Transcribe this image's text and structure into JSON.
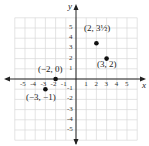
{
  "axes": {
    "x_label": "x",
    "y_label": "y",
    "x_ticks": [
      "-5",
      "-4",
      "-3",
      "-2",
      "-1",
      "1",
      "2",
      "3",
      "4",
      "5"
    ],
    "y_ticks": [
      "5",
      "4",
      "3",
      "2",
      "1",
      "-1",
      "-2",
      "-3",
      "-4",
      "-5"
    ],
    "range": [
      -6,
      6
    ]
  },
  "points": [
    {
      "x": -2,
      "y": 0,
      "label": "(−2, 0)"
    },
    {
      "x": -3,
      "y": -1,
      "label": "(−3, −1)"
    },
    {
      "x": 2,
      "y": 3.5,
      "label": "(2, 3½)"
    },
    {
      "x": 3,
      "y": 2,
      "label": "(3, 2)"
    }
  ],
  "colors": {
    "grid": "#d8d8d8",
    "axis": "#222222",
    "point": "#111111"
  }
}
